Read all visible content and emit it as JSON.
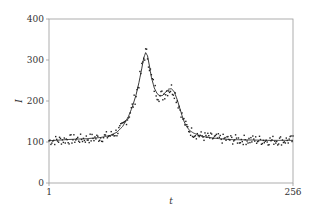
{
  "chart_data": {
    "type": "line",
    "title": "",
    "xlabel": "t",
    "ylabel": "I",
    "xlim": [
      1,
      256
    ],
    "ylim": [
      0,
      400
    ],
    "x_ticks": [
      {
        "value": 1,
        "label": "1"
      },
      {
        "value": 256,
        "label": "256"
      }
    ],
    "y_ticks": [
      {
        "value": 0,
        "label": "0"
      },
      {
        "value": 100,
        "label": "100"
      },
      {
        "value": 200,
        "label": "200"
      },
      {
        "value": 300,
        "label": "300"
      },
      {
        "value": 400,
        "label": "400"
      }
    ],
    "grid": false,
    "legend": null,
    "series": [
      {
        "name": "fitted curve",
        "style": "line",
        "x": [
          1,
          20,
          40,
          55,
          65,
          72,
          78,
          84,
          88,
          92,
          95,
          98,
          100,
          102,
          104,
          106,
          108,
          111,
          114,
          117,
          120,
          123,
          126,
          129,
          132,
          135,
          138,
          141,
          144,
          148,
          152,
          158,
          165,
          175,
          190,
          210,
          230,
          256
        ],
        "y": [
          103,
          106,
          108,
          111,
          116,
          124,
          138,
          162,
          185,
          215,
          245,
          280,
          305,
          318,
          310,
          285,
          258,
          232,
          218,
          212,
          214,
          222,
          229,
          230,
          222,
          203,
          180,
          157,
          140,
          128,
          122,
          116,
          112,
          109,
          106,
          105,
          104,
          104
        ]
      },
      {
        "name": "measured points",
        "style": "scatter",
        "noise_amplitude": 12,
        "count_per_unit": 1
      }
    ]
  }
}
